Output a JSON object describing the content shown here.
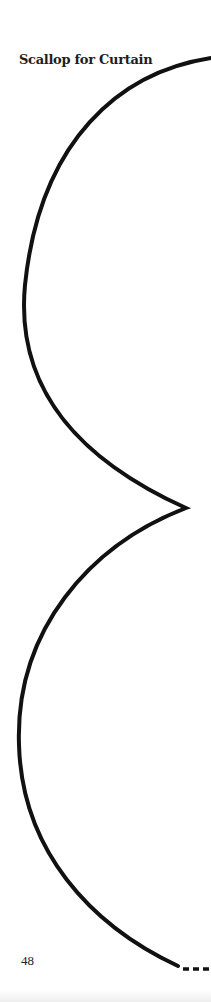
{
  "page": {
    "title": "Scallop for Curtain",
    "page_number": "48"
  },
  "pattern": {
    "shape": "scallop-outline",
    "line_color": "#111111",
    "has_dashed_fold_line": true
  }
}
